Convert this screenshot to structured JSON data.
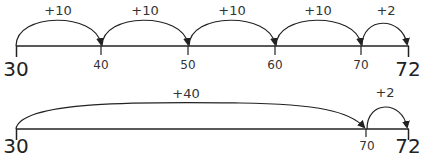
{
  "diagram": {
    "number_lines": [
      {
        "name": "number-line-ten-jumps",
        "start": "30",
        "end": "72",
        "ticks": [
          "30",
          "40",
          "50",
          "60",
          "70",
          "72"
        ],
        "jumps": [
          {
            "from": "30",
            "to": "40",
            "label": "+10"
          },
          {
            "from": "40",
            "to": "50",
            "label": "+10"
          },
          {
            "from": "50",
            "to": "60",
            "label": "+10"
          },
          {
            "from": "60",
            "to": "70",
            "label": "+10"
          },
          {
            "from": "70",
            "to": "72",
            "label": "+2"
          }
        ]
      },
      {
        "name": "number-line-forty-jump",
        "start": "30",
        "end": "72",
        "ticks": [
          "30",
          "70",
          "72"
        ],
        "jumps": [
          {
            "from": "30",
            "to": "70",
            "label": "+40"
          },
          {
            "from": "70",
            "to": "72",
            "label": "+2"
          }
        ]
      }
    ],
    "colors": {
      "line": "#222222",
      "text": "#333333",
      "background": "#ffffff"
    }
  }
}
